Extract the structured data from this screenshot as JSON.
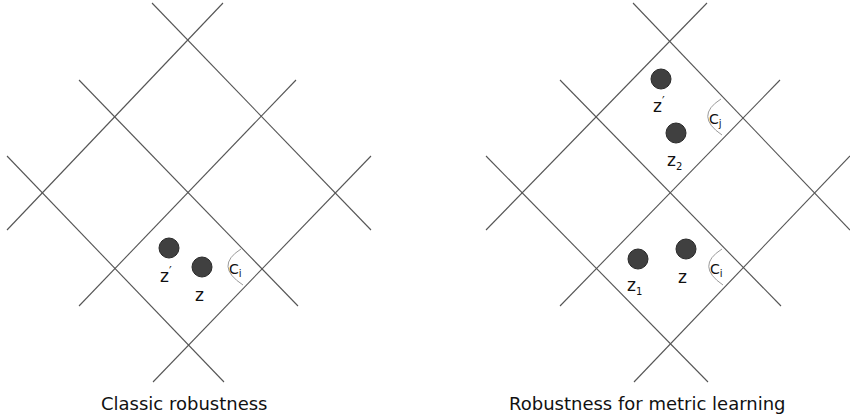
{
  "panels": [
    {
      "caption": "Classic robustness",
      "points": [
        {
          "label": "z′",
          "base": "z",
          "sup": "′",
          "sub": ""
        },
        {
          "label": "z",
          "base": "z",
          "sup": "",
          "sub": ""
        }
      ],
      "cells": [
        {
          "base": "C",
          "sub": "i"
        }
      ]
    },
    {
      "caption": "Robustness for metric learning",
      "points": [
        {
          "label": "z′",
          "base": "z",
          "sup": "′",
          "sub": ""
        },
        {
          "label": "z2",
          "base": "z",
          "sup": "",
          "sub": "2"
        },
        {
          "label": "z1",
          "base": "z",
          "sup": "",
          "sub": "1"
        },
        {
          "label": "z",
          "base": "z",
          "sup": "",
          "sub": ""
        }
      ],
      "cells": [
        {
          "base": "C",
          "sub": "j"
        },
        {
          "base": "C",
          "sub": "i"
        }
      ]
    }
  ],
  "colors": {
    "lines": "#555555",
    "points": "#404040",
    "arcs": "#9a9a9a"
  }
}
